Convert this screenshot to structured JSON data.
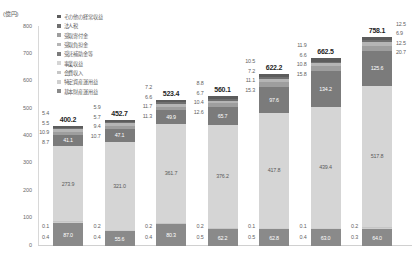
{
  "chart_data": {
    "type": "bar",
    "stacked": true,
    "title": "",
    "subtitle": "",
    "xlabel": "",
    "ylabel": "(億円)",
    "ylim": [
      0,
      800
    ],
    "ytick_step": 100,
    "yticks": [
      "800",
      "700",
      "600",
      "500",
      "400",
      "300",
      "200",
      "100",
      "0"
    ],
    "grid": false,
    "legend_position": "top-left",
    "categories": [
      "2012",
      "2013",
      "2014",
      "2015",
      "2016",
      "2017",
      "2018"
    ],
    "category_sublabels": [
      "(n=57)",
      "(n=54)",
      "(n=57)",
      "(n=59)",
      "(n=59)",
      "(n=60)",
      "(n=60)"
    ],
    "totals": [
      "400.2",
      "452.7",
      "523.4",
      "560.1",
      "622.2",
      "662.5",
      "758.1"
    ],
    "series": [
      {
        "name": "基本研究関係",
        "color": "#8a8a8a",
        "values": [
          87.0,
          55.6,
          80.3,
          62.2,
          62.8,
          63.0,
          64.0
        ],
        "labels": [
          "87.0",
          "55.6",
          "80.3",
          "62.2",
          "62.8",
          "63.0",
          "64.0"
        ],
        "show_inline": true
      },
      {
        "name": "特定疾患関係",
        "color": "#cfcfcf",
        "values": [
          0.4,
          0.4,
          0.4,
          0.5,
          0.5,
          0.4,
          0.3
        ],
        "labels": [
          "0.4",
          "0.4",
          "0.4",
          "0.5",
          "0.5",
          "0.4",
          "0.3"
        ],
        "show_inline": false
      },
      {
        "name": "会費収入",
        "color": "#c6c6c6",
        "values": [
          0.1,
          0.2,
          0.2,
          0.2,
          0.1,
          0.1,
          0.2
        ],
        "labels": [
          "0.1",
          "0.2",
          "0.2",
          "0.2",
          "0.1",
          "0.1",
          "0.2"
        ],
        "show_inline": false
      },
      {
        "name": "事業収益",
        "color": "#d5d5d5",
        "values": [
          273.9,
          321.0,
          361.7,
          376.2,
          417.8,
          439.4,
          517.8
        ],
        "labels": [
          "273.9",
          "321.0",
          "361.7",
          "376.2",
          "417.8",
          "439.4",
          "517.8"
        ],
        "show_inline": true
      },
      {
        "name": "受託補助金等",
        "color": "#7b7b7b",
        "values": [
          41.1,
          47.1,
          49.9,
          65.7,
          97.6,
          134.2,
          125.6
        ],
        "labels": [
          "41.1",
          "47.1",
          "49.9",
          "65.7",
          "97.6",
          "134.2",
          "125.6"
        ],
        "show_inline": true
      },
      {
        "name": "受取寄付金",
        "color": "#9e9e9e",
        "values": [
          8.7,
          10.7,
          11.3,
          12.6,
          15.3,
          15.8,
          20.7
        ],
        "labels": [
          "8.7",
          "10.7",
          "11.3",
          "12.6",
          "15.3",
          "15.8",
          "20.7"
        ],
        "show_inline": false
      },
      {
        "name": "受取負担金",
        "color": "#b5b5b5",
        "values": [
          10.9,
          9.4,
          11.7,
          10.4,
          11.1,
          10.8,
          12.5
        ],
        "labels": [
          "10.9",
          "9.4",
          "11.7",
          "10.4",
          "11.1",
          "10.8",
          "12.5"
        ],
        "show_inline": false
      },
      {
        "name": "法人税",
        "color": "#6f6f6f",
        "values": [
          5.5,
          5.7,
          6.6,
          6.7,
          7.2,
          6.6,
          6.9
        ],
        "labels": [
          "5.5",
          "5.7",
          "6.6",
          "6.7",
          "7.2",
          "6.6",
          "6.9"
        ],
        "show_inline": false
      },
      {
        "name": "その他の経常収益",
        "color": "#5c5c5c",
        "values": [
          5.4,
          5.9,
          7.2,
          8.8,
          10.5,
          11.9,
          12.5
        ],
        "labels": [
          "5.4",
          "5.9",
          "7.2",
          "8.8",
          "10.5",
          "11.9",
          "12.5"
        ],
        "show_inline": false
      }
    ],
    "legend_entries": [
      {
        "label": "その他の経常収益",
        "color": "#5c5c5c"
      },
      {
        "label": "法人税",
        "color": "#6f6f6f"
      },
      {
        "label": "受取寄付金",
        "color": "#9e9e9e"
      },
      {
        "label": "受取負担金",
        "color": "#b5b5b5"
      },
      {
        "label": "受託補助金等",
        "color": "#7b7b7b"
      },
      {
        "label": "事業収益",
        "color": "#d5d5d5"
      },
      {
        "label": "会費収入",
        "color": "#c6c6c6"
      },
      {
        "label": "特定資産運用益",
        "color": "#cfcfcf"
      },
      {
        "label": "基本財産運用益",
        "color": "#8a8a8a"
      }
    ]
  }
}
